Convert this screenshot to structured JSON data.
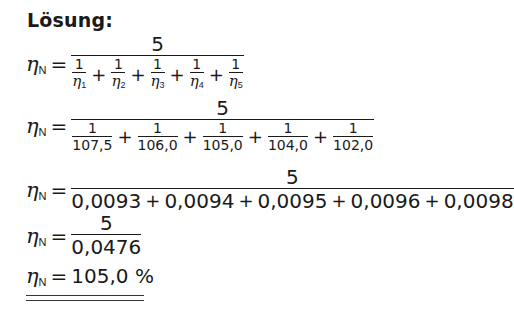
{
  "title": "Lösung:",
  "lhs_symbol": "η",
  "lhs_sub": "N",
  "equals": "=",
  "plus": "+",
  "line1": {
    "numerator": "5",
    "terms": [
      {
        "n": "1",
        "sym": "η",
        "sub": "1"
      },
      {
        "n": "1",
        "sym": "η",
        "sub": "2"
      },
      {
        "n": "1",
        "sym": "η",
        "sub": "3"
      },
      {
        "n": "1",
        "sym": "η",
        "sub": "4"
      },
      {
        "n": "1",
        "sym": "η",
        "sub": "5"
      }
    ]
  },
  "line2": {
    "numerator": "5",
    "terms": [
      {
        "n": "1",
        "d": "107,5"
      },
      {
        "n": "1",
        "d": "106,0"
      },
      {
        "n": "1",
        "d": "105,0"
      },
      {
        "n": "1",
        "d": "104,0"
      },
      {
        "n": "1",
        "d": "102,0"
      }
    ]
  },
  "line3": {
    "numerator": "5",
    "terms": [
      "0,0093",
      "0,0094",
      "0,0095",
      "0,0096",
      "0,0098"
    ]
  },
  "line4": {
    "numerator": "5",
    "denominator": "0,0476"
  },
  "line5": {
    "result": "105,0 %"
  }
}
